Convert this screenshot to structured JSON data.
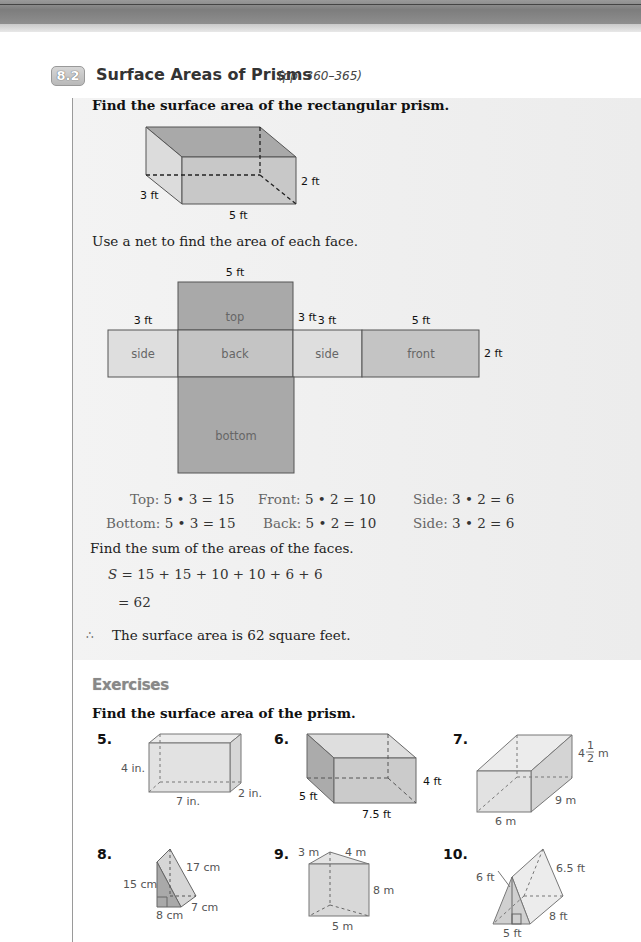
{
  "section": {
    "number": "8.2",
    "title": "Surface Areas of Prisms",
    "pages": "(pp. 360–365)"
  },
  "example": {
    "instruction": "Find the surface area of the rectangular prism.",
    "prism_labels": {
      "depth": "3 ft",
      "width": "5 ft",
      "height": "2 ft"
    },
    "net_instruction": "Use a net to find the area of each face.",
    "net": {
      "faces": [
        "top",
        "side",
        "back",
        "side",
        "front",
        "bottom"
      ],
      "labels": {
        "top_width": "5 ft",
        "top_height": "3 ft",
        "left_side_width": "3 ft",
        "right_side_width": "3 ft",
        "front_width": "5 ft",
        "front_height": "2 ft"
      }
    },
    "face_areas": [
      {
        "label": "Top:",
        "expr": "5 • 3 = 15"
      },
      {
        "label": "Front:",
        "expr": "5 • 2 = 10"
      },
      {
        "label": "Side:",
        "expr": "3 • 2 = 6"
      },
      {
        "label": "Bottom:",
        "expr": "5 • 3 = 15"
      },
      {
        "label": "Back:",
        "expr": "5 • 2 = 10"
      },
      {
        "label": "Side:",
        "expr": "3 • 2 = 6"
      }
    ],
    "sum_instruction": "Find the sum of the areas of the faces.",
    "sum_line1_var": "S",
    "sum_line1": "= 15 + 15 + 10 + 10 + 6 + 6",
    "sum_line2": "= 62",
    "conclusion_symbol": "∴",
    "conclusion": "The surface area is 62 square feet."
  },
  "exercises": {
    "title": "Exercises",
    "instruction": "Find the surface area of the prism.",
    "items": [
      {
        "number": "5.",
        "labels": [
          "4 in.",
          "7 in.",
          "2 in."
        ]
      },
      {
        "number": "6.",
        "labels": [
          "5 ft",
          "7.5 ft",
          "4 ft"
        ]
      },
      {
        "number": "7.",
        "labels": [
          "4",
          "1",
          "2",
          "m",
          "9 m",
          "6 m"
        ]
      },
      {
        "number": "8.",
        "labels": [
          "15 cm",
          "17 cm",
          "8 cm",
          "7 cm"
        ]
      },
      {
        "number": "9.",
        "labels": [
          "3 m",
          "4 m",
          "8 m",
          "5 m"
        ]
      },
      {
        "number": "10.",
        "labels": [
          "6 ft",
          "6.5 ft",
          "8 ft",
          "5 ft"
        ]
      }
    ]
  },
  "colors": {
    "face_dark": "#a9a9a9",
    "face_mid": "#c4c4c4",
    "face_light": "#dedede",
    "example_bg": "#efefef"
  }
}
